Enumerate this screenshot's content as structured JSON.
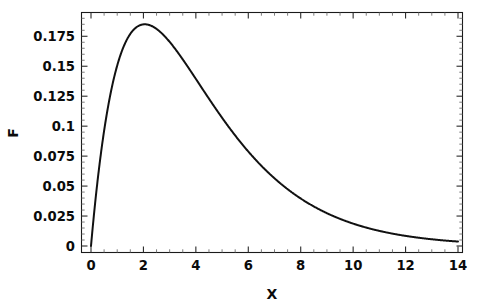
{
  "figure": {
    "background_color": "#ffffff",
    "curve_color": "#111111",
    "axis_color": "#1a1a1a",
    "width": 485,
    "height": 308
  },
  "axes": {
    "x_title": "X",
    "y_title": "F",
    "x_tick_labels": [
      "0",
      "2",
      "4",
      "6",
      "8",
      "10",
      "12",
      "14"
    ],
    "y_tick_labels": [
      "0",
      "0.025",
      "0.05",
      "0.075",
      "0.1",
      "0.125",
      "0.15",
      "0.175"
    ]
  },
  "chart_data": {
    "type": "line",
    "title": "",
    "subtitle": "",
    "xlabel": "X",
    "ylabel": "F",
    "xlim": [
      0,
      14
    ],
    "ylim": [
      0,
      0.1925
    ],
    "xticks": [
      0,
      2,
      4,
      6,
      8,
      10,
      12,
      14
    ],
    "yticks": [
      0,
      0.025,
      0.05,
      0.075,
      0.1,
      0.125,
      0.15,
      0.175
    ],
    "x_minor_tick_step": 0.5,
    "y_minor_tick_step": 0.005,
    "grid": false,
    "legend": null,
    "legend_position": "none",
    "annotations": [],
    "series": [
      {
        "name": "F",
        "description": "Unimodal right-skewed distribution (gamma-like, shape 2, scale ~2.05); rises steeply from near 0 at x=0 to a peak of about 0.185 near x=2, then decays slowly toward 0.004 at x=14.",
        "peak_x": 2.05,
        "peak_y": 0.185,
        "x": [
          0.0,
          0.1,
          0.2,
          0.3,
          0.4,
          0.5,
          0.75,
          1.0,
          1.25,
          1.5,
          1.75,
          2.0,
          2.05,
          2.25,
          2.5,
          2.75,
          3.0,
          3.25,
          3.5,
          3.75,
          4.0,
          4.5,
          5.0,
          5.5,
          6.0,
          6.5,
          7.0,
          7.5,
          8.0,
          8.5,
          9.0,
          9.5,
          10.0,
          10.5,
          11.0,
          11.5,
          12.0,
          12.5,
          13.0,
          13.5,
          14.0
        ],
        "y": [
          0.0,
          0.0113,
          0.0216,
          0.0308,
          0.0392,
          0.0467,
          0.0625,
          0.0748,
          0.0842,
          0.0912,
          0.0961,
          0.0994,
          0.0995,
          0.1013,
          0.1021,
          0.1018,
          0.1006,
          0.0988,
          0.0964,
          0.0936,
          0.0904,
          0.0834,
          0.0756,
          0.0676,
          0.0597,
          0.0521,
          0.045,
          0.0385,
          0.0327,
          0.0276,
          0.0231,
          0.0192,
          0.0159,
          0.0131,
          0.0107,
          0.0087,
          0.0071,
          0.0057,
          0.0046,
          0.0037,
          0.0029
        ],
        "y_note": "values listed above are the normalized gamma pdf shape; the plotted F values are these scaled so the maximum equals 0.185"
      }
    ]
  }
}
